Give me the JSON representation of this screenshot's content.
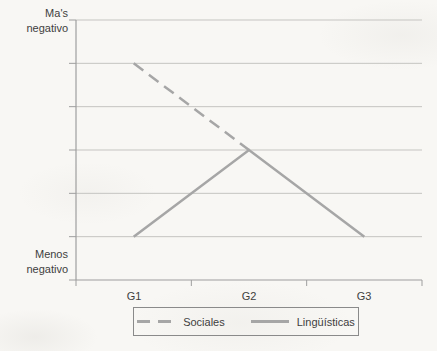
{
  "chart_data": {
    "type": "line",
    "title": "",
    "categories": [
      "G1",
      "G2",
      "G3"
    ],
    "series": [
      {
        "name": "Sociales",
        "line": "dashed",
        "values": [
          5,
          3,
          null
        ]
      },
      {
        "name": "Lingüísticas",
        "line": "solid",
        "values": [
          1,
          3,
          1
        ]
      }
    ],
    "y_axis": {
      "top_label": "Ma's negativo",
      "bottom_label": "Menos negativo",
      "min": 0,
      "max": 6,
      "gridline_step": 1,
      "numeric_tick_labels_shown": false
    },
    "y_axis_top_label_lines": [
      "Ma's",
      "negativo"
    ],
    "y_axis_bottom_label_lines": [
      "Menos",
      "negativo"
    ],
    "legend": {
      "position": "bottom",
      "items": [
        "Sociales",
        "Lingüísticas"
      ]
    },
    "grid": true,
    "colors": {
      "series_gray": "#a6a6a6",
      "gridline": "#c5c4c1",
      "axis": "#9e9e9e",
      "text": "#3e3e3e",
      "legend_border": "#8a8a8a",
      "background": "#f8f7f4"
    }
  }
}
